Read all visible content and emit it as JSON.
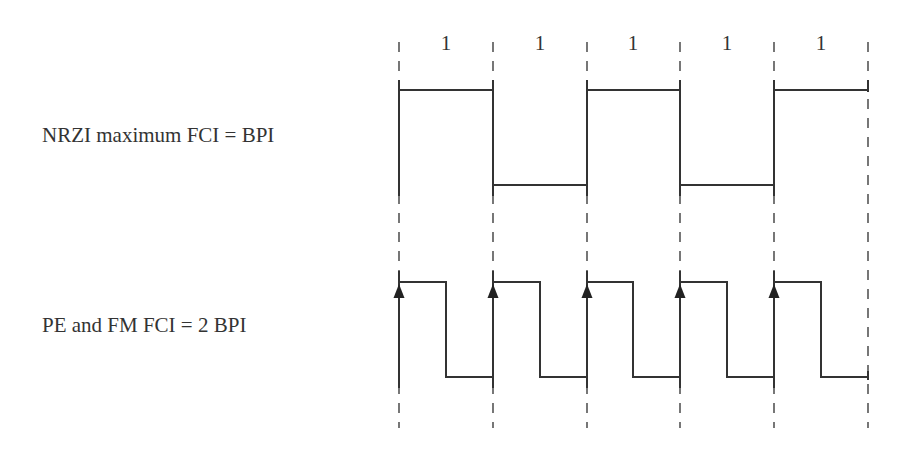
{
  "diagram": {
    "title": "",
    "bits": [
      "1",
      "1",
      "1",
      "1",
      "1"
    ],
    "rows": [
      {
        "id": "nrzi",
        "label": "NRZI maximum FCI = BPI",
        "encoding": "NRZI",
        "description": "One flux transition per bit cell (at cell boundaries)",
        "levels": [
          "high",
          "low",
          "high",
          "low",
          "high"
        ]
      },
      {
        "id": "pe_fm",
        "label": "PE and FM FCI = 2 BPI",
        "encoding": "PE / FM",
        "description": "Two flux transitions per bit cell (rising edge at cell boundary marked with arrow, falling edge mid-cell)",
        "levels_per_cell": [
          [
            "high",
            "low"
          ],
          [
            "high",
            "low"
          ],
          [
            "high",
            "low"
          ],
          [
            "high",
            "low"
          ],
          [
            "high",
            "low"
          ]
        ],
        "arrow_markers": 5
      }
    ],
    "cell_boundaries_x": [
      399,
      493,
      587,
      680,
      774,
      868
    ],
    "colors": {
      "line": "#333333",
      "dashed": "#555555",
      "background": "#ffffff"
    }
  }
}
